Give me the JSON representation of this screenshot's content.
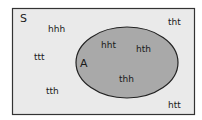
{
  "diagram": {
    "type": "venn",
    "universe": {
      "label": "S",
      "fill": "#eaeaea",
      "stroke": "#333333"
    },
    "set_a": {
      "label": "A",
      "fill": "#a9a9a9",
      "stroke": "#222222"
    },
    "outside_elements": [
      {
        "id": "hhh",
        "label": "hhh",
        "x": 48,
        "y": 32
      },
      {
        "id": "ttt",
        "label": "ttt",
        "x": 34,
        "y": 60
      },
      {
        "id": "tth",
        "label": "tth",
        "x": 46,
        "y": 94
      },
      {
        "id": "tht",
        "label": "tht",
        "x": 168,
        "y": 25
      },
      {
        "id": "htt",
        "label": "htt",
        "x": 168,
        "y": 108
      }
    ],
    "inside_elements": [
      {
        "id": "hht",
        "label": "hht",
        "x": 101,
        "y": 48
      },
      {
        "id": "hth",
        "label": "hth",
        "x": 136,
        "y": 52
      },
      {
        "id": "thh",
        "label": "thh",
        "x": 119,
        "y": 82
      }
    ]
  }
}
